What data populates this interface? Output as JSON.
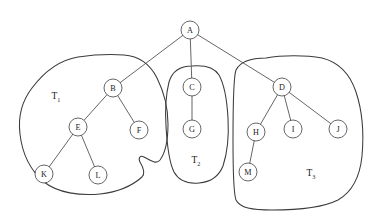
{
  "diagram": {
    "type": "node-link-tree",
    "background_color": "#ffffff",
    "stroke_color": "#4a4a4a",
    "blob_stroke_color": "#3b3b3b",
    "node_fill_color": "#ffffff",
    "node_radius": 9,
    "nodes": [
      {
        "id": "A",
        "label": "A",
        "x": 190,
        "y": 30,
        "group": null
      },
      {
        "id": "B",
        "label": "B",
        "x": 113,
        "y": 88,
        "group": "T1"
      },
      {
        "id": "C",
        "label": "C",
        "x": 192,
        "y": 87,
        "group": "T2"
      },
      {
        "id": "D",
        "label": "D",
        "x": 282,
        "y": 87,
        "group": "T3"
      },
      {
        "id": "E",
        "label": "E",
        "x": 78,
        "y": 127,
        "group": "T1"
      },
      {
        "id": "F",
        "label": "F",
        "x": 139,
        "y": 130,
        "group": "T1"
      },
      {
        "id": "G",
        "label": "G",
        "x": 192,
        "y": 129,
        "group": "T2"
      },
      {
        "id": "H",
        "label": "H",
        "x": 256,
        "y": 132,
        "group": "T3"
      },
      {
        "id": "I",
        "label": "I",
        "x": 293,
        "y": 129,
        "group": "T3"
      },
      {
        "id": "J",
        "label": "J",
        "x": 338,
        "y": 129,
        "group": "T3"
      },
      {
        "id": "K",
        "label": "K",
        "x": 44,
        "y": 174,
        "group": "T1"
      },
      {
        "id": "L",
        "label": "L",
        "x": 98,
        "y": 175,
        "group": "T1"
      },
      {
        "id": "M",
        "label": "M",
        "x": 248,
        "y": 172,
        "group": "T3"
      }
    ],
    "edges": [
      {
        "from": "A",
        "to": "B"
      },
      {
        "from": "A",
        "to": "C"
      },
      {
        "from": "A",
        "to": "D"
      },
      {
        "from": "B",
        "to": "E"
      },
      {
        "from": "B",
        "to": "F"
      },
      {
        "from": "E",
        "to": "K"
      },
      {
        "from": "E",
        "to": "L"
      },
      {
        "from": "C",
        "to": "G"
      },
      {
        "from": "D",
        "to": "H"
      },
      {
        "from": "D",
        "to": "I"
      },
      {
        "from": "D",
        "to": "J"
      },
      {
        "from": "H",
        "to": "M"
      }
    ],
    "groups": [
      {
        "id": "T1",
        "base": "T",
        "subscript": "1",
        "label_x": 56,
        "label_y": 96,
        "members": [
          "B",
          "E",
          "F",
          "K",
          "L"
        ]
      },
      {
        "id": "T2",
        "base": "T",
        "subscript": "2",
        "label_x": 196,
        "label_y": 160,
        "members": [
          "C",
          "G"
        ]
      },
      {
        "id": "T3",
        "base": "T",
        "subscript": "3",
        "label_x": 311,
        "label_y": 173,
        "members": [
          "D",
          "H",
          "I",
          "J",
          "M"
        ]
      }
    ],
    "group_outlines": {
      "T1": "M 78 57 C 60 60 44 72 32 88 C 22 101 18 118 20 134 C 22 152 30 170 44 182 C 58 193 80 196 100 194 C 118 192 132 186 142 177 C 146 173 143 167 140 162 C 138 158 140 155 144 157 C 150 160 156 165 160 160 C 166 152 168 138 168 124 C 168 110 164 92 157 78 C 150 64 138 56 124 55 C 108 54 92 55 78 57 Z",
      "T2": "M 192 66 C 180 66 172 72 169 82 C 166 94 165 110 166 126 C 167 144 169 162 174 172 C 179 181 188 184 199 183 C 211 182 219 176 223 166 C 227 154 229 136 228 118 C 227 100 224 84 219 75 C 214 67 204 65 192 66 Z",
      "T3": "M 266 58 C 250 58 240 62 236 70 C 233 78 233 110 233 140 C 233 168 233 192 236 200 C 240 208 252 210 272 210 C 296 210 322 208 338 200 C 352 192 360 176 362 156 C 364 134 362 110 356 92 C 350 74 338 62 322 58 C 306 55 282 55 266 58 Z"
    }
  }
}
